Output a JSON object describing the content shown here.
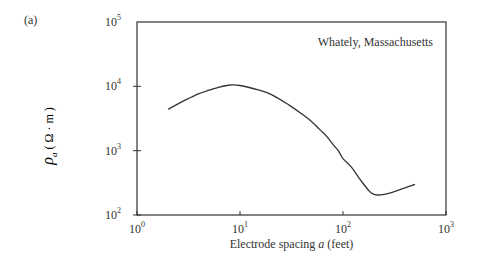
{
  "panel_label": "(a)",
  "chart_data": {
    "type": "line",
    "title": "",
    "annotation": "Whately, Massachusetts",
    "xlabel": "Electrode spacing a (feet)",
    "xlabel_parts": {
      "pre": "Electrode spacing ",
      "var": "a",
      "post": " (feet)"
    },
    "ylabel": "ρa (Ω·m)",
    "x_scale": "log",
    "y_scale": "log",
    "xlim": [
      1,
      1000
    ],
    "ylim": [
      100,
      100000
    ],
    "x_ticks": [
      {
        "base": "10",
        "exp": "0",
        "value": 1
      },
      {
        "base": "10",
        "exp": "1",
        "value": 10
      },
      {
        "base": "10",
        "exp": "2",
        "value": 100
      },
      {
        "base": "10",
        "exp": "3",
        "value": 1000
      }
    ],
    "y_ticks": [
      {
        "base": "10",
        "exp": "2",
        "value": 100
      },
      {
        "base": "10",
        "exp": "3",
        "value": 1000
      },
      {
        "base": "10",
        "exp": "4",
        "value": 10000
      },
      {
        "base": "10",
        "exp": "5",
        "value": 100000
      }
    ],
    "grid": false,
    "legend": null,
    "series": [
      {
        "name": "Apparent resistivity",
        "x": [
          2,
          3,
          4,
          5,
          6,
          8,
          10,
          15,
          20,
          30,
          40,
          50,
          60,
          70,
          80,
          90,
          100,
          120,
          150,
          180,
          200,
          230,
          300,
          400,
          500
        ],
        "y": [
          4400,
          6200,
          7700,
          8700,
          9500,
          10500,
          10300,
          8800,
          7500,
          5100,
          3700,
          2800,
          2100,
          1650,
          1250,
          1000,
          750,
          560,
          340,
          235,
          210,
          205,
          225,
          265,
          300
        ]
      }
    ]
  }
}
